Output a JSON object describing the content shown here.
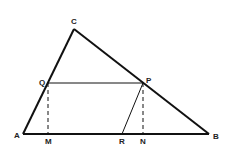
{
  "diagram": {
    "type": "geometry",
    "colors": {
      "stroke": "#111111",
      "background": "#ffffff"
    },
    "points": {
      "A": {
        "label": "A",
        "x": 23,
        "y": 134
      },
      "B": {
        "label": "B",
        "x": 209,
        "y": 134
      },
      "C": {
        "label": "C",
        "x": 74,
        "y": 29
      },
      "Q": {
        "label": "Q",
        "x": 48,
        "y": 83
      },
      "P": {
        "label": "P",
        "x": 143,
        "y": 83
      },
      "M": {
        "label": "M",
        "x": 48,
        "y": 134
      },
      "R": {
        "label": "R",
        "x": 122,
        "y": 134
      },
      "N": {
        "label": "N",
        "x": 143,
        "y": 134
      }
    },
    "segments": [
      {
        "from": "A",
        "to": "B",
        "style": "solid-thick"
      },
      {
        "from": "A",
        "to": "C",
        "style": "solid-thick"
      },
      {
        "from": "C",
        "to": "B",
        "style": "solid-thick"
      },
      {
        "from": "Q",
        "to": "P",
        "style": "solid-thin"
      },
      {
        "from": "P",
        "to": "R",
        "style": "solid-thin"
      },
      {
        "from": "Q",
        "to": "M",
        "style": "dashed"
      },
      {
        "from": "P",
        "to": "N",
        "style": "dashed"
      }
    ]
  }
}
